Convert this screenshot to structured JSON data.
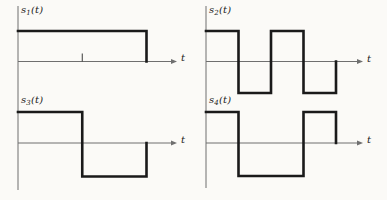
{
  "figure": {
    "background": "#fbfaf7",
    "ink_color": "#1a1a1a",
    "axis_color": "#6f6f6f",
    "label_color": "#222222"
  },
  "chart_data": {
    "type": "line",
    "subtype": "piecewise-constant-rectangular-waveforms",
    "title": "",
    "x_axis_label": "t",
    "grid": false,
    "legend": "none",
    "plots": [
      {
        "id": "s1",
        "label": {
          "base": "s",
          "sub": "1",
          "args": "(t)"
        },
        "xlabel": "t",
        "ylim": [
          -1,
          1
        ],
        "axis_ticks": [
          0.5
        ],
        "segments": [
          {
            "from": 0,
            "to": 1,
            "level": 1
          }
        ],
        "ends_at_zero": true
      },
      {
        "id": "s2",
        "label": {
          "base": "s",
          "sub": "2",
          "args": "(t)"
        },
        "xlabel": "t",
        "ylim": [
          -1,
          1
        ],
        "axis_ticks": [],
        "segments": [
          {
            "from": 0,
            "to": 0.25,
            "level": 1
          },
          {
            "from": 0.25,
            "to": 0.5,
            "level": -1
          },
          {
            "from": 0.5,
            "to": 0.75,
            "level": 1
          },
          {
            "from": 0.75,
            "to": 1,
            "level": -1
          }
        ],
        "ends_at_zero": true
      },
      {
        "id": "s3",
        "label": {
          "base": "s",
          "sub": "3",
          "args": "(t)"
        },
        "xlabel": "t",
        "ylim": [
          -1,
          1
        ],
        "axis_ticks": [],
        "segments": [
          {
            "from": 0,
            "to": 0.5,
            "level": 1
          },
          {
            "from": 0.5,
            "to": 1,
            "level": -1
          }
        ],
        "ends_at_zero": true
      },
      {
        "id": "s4",
        "label": {
          "base": "s",
          "sub": "4",
          "args": "(t)"
        },
        "xlabel": "t",
        "ylim": [
          -1,
          1
        ],
        "axis_ticks": [],
        "segments": [
          {
            "from": 0,
            "to": 0.25,
            "level": 1
          },
          {
            "from": 0.25,
            "to": 0.75,
            "level": -1
          },
          {
            "from": 0.75,
            "to": 1,
            "level": 1
          }
        ],
        "ends_at_zero": true
      }
    ]
  }
}
